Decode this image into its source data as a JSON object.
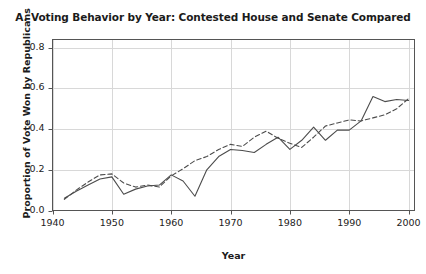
{
  "chart_data": {
    "type": "line",
    "title": "A. Voting Behavior by Year: Contested House and Senate Compared",
    "xlabel": "Year",
    "ylabel": "Proportion of Vote Won by Republicans",
    "xlim": [
      1940,
      2001
    ],
    "ylim": [
      0.0,
      0.84
    ],
    "xticks": [
      1940,
      1950,
      1960,
      1970,
      1980,
      1990,
      2000
    ],
    "xtick_labels": [
      "1940",
      "1950",
      "1960",
      "1970",
      "1980",
      "1990",
      "2000"
    ],
    "yticks": [
      0.0,
      0.2,
      0.4,
      0.6,
      0.8
    ],
    "ytick_labels": [
      "0.0",
      "0.2",
      "0.4",
      "0.6",
      "0.8"
    ],
    "grid": true,
    "grid_color": "#d8d8d8",
    "legend": false,
    "axis_color": "#555555",
    "x": [
      1942,
      1944,
      1946,
      1948,
      1950,
      1952,
      1954,
      1956,
      1958,
      1960,
      1962,
      1964,
      1966,
      1968,
      1970,
      1972,
      1974,
      1976,
      1978,
      1980,
      1982,
      1984,
      1986,
      1988,
      1990,
      1992,
      1994,
      1996,
      1998,
      2000
    ],
    "series": [
      {
        "name": "Contested House",
        "style": "solid",
        "color": "#4c4c4c",
        "values": [
          0.06,
          0.095,
          0.125,
          0.155,
          0.165,
          0.08,
          0.105,
          0.12,
          0.125,
          0.175,
          0.145,
          0.07,
          0.2,
          0.265,
          0.3,
          0.295,
          0.285,
          0.325,
          0.36,
          0.3,
          0.345,
          0.41,
          0.345,
          0.395,
          0.395,
          0.44,
          0.56,
          0.535,
          0.545,
          0.54
        ]
      },
      {
        "name": "Contested Senate",
        "style": "dashed",
        "color": "#4c4c4c",
        "values": [
          0.055,
          0.1,
          0.14,
          0.175,
          0.18,
          0.135,
          0.115,
          0.125,
          0.115,
          0.17,
          0.205,
          0.245,
          0.265,
          0.3,
          0.325,
          0.315,
          0.36,
          0.39,
          0.355,
          0.33,
          0.31,
          0.36,
          0.415,
          0.43,
          0.445,
          0.44,
          0.455,
          0.47,
          0.5,
          0.55
        ]
      }
    ]
  }
}
